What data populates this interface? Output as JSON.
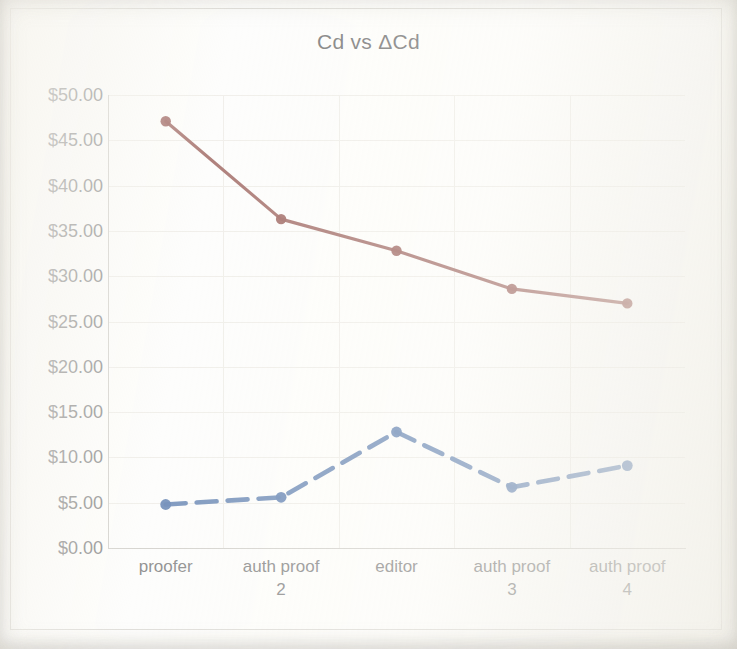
{
  "chart_data": {
    "type": "line",
    "title": "Cd vs ΔCd",
    "xlabel": "",
    "ylabel": "",
    "ylim": [
      0,
      50
    ],
    "ytick_step": 5,
    "grid": true,
    "legend": "none",
    "categories": [
      "proofer",
      "auth proof 2",
      "editor",
      "auth proof 3",
      "auth proof 4"
    ],
    "category_lines": [
      [
        "proofer"
      ],
      [
        "auth proof",
        "2"
      ],
      [
        "editor"
      ],
      [
        "auth proof",
        "3"
      ],
      [
        "auth proof",
        "4"
      ]
    ],
    "ytick_labels": [
      "$50.00",
      "$45.00",
      "$40.00",
      "$35.00",
      "$30.00",
      "$25.00",
      "$20.00",
      "$15.00",
      "$10.00",
      "$5.00",
      "$0.00"
    ],
    "ytick_values": [
      50,
      45,
      40,
      35,
      30,
      25,
      20,
      15,
      10,
      5,
      0
    ],
    "series": [
      {
        "name": "Cd",
        "style": "solid",
        "color": "#8c4a43",
        "marker": "circle",
        "values": [
          47.1,
          36.3,
          32.8,
          28.6,
          27.0
        ]
      },
      {
        "name": "ΔCd",
        "style": "dashed",
        "color": "#4a6fa5",
        "marker": "circle",
        "values": [
          4.8,
          5.6,
          12.8,
          6.7,
          9.1
        ]
      }
    ]
  },
  "colors": {
    "series_cd": "#8c4a43",
    "series_delta_cd": "#4a6fa5",
    "axis": "#c9c7c1",
    "grid": "#eceae4",
    "text": "#6f6f6f",
    "title_text": "#595959",
    "frame": "#d8d6d0",
    "background": "#fdfdfb"
  }
}
